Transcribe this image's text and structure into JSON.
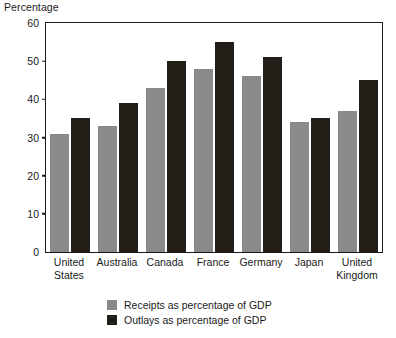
{
  "chart_data": {
    "type": "bar",
    "title": "",
    "subtitle": "",
    "xlabel": "",
    "ylabel": "Percentage",
    "ylim": [
      0,
      60
    ],
    "yticks": [
      0,
      10,
      20,
      30,
      40,
      50,
      60
    ],
    "grid": false,
    "legend_position": "bottom",
    "categories": [
      "United States",
      "Australia",
      "Canada",
      "France",
      "Germany",
      "Japan",
      "United Kingdom"
    ],
    "category_lines": [
      [
        "United",
        "States"
      ],
      [
        "Australia",
        ""
      ],
      [
        "Canada",
        ""
      ],
      [
        "France",
        ""
      ],
      [
        "Germany",
        ""
      ],
      [
        "Japan",
        ""
      ],
      [
        "United",
        "Kingdom"
      ]
    ],
    "series": [
      {
        "name": "Receipts as percentage of GDP",
        "color": "#8a8a8a",
        "values": [
          31,
          33,
          43,
          48,
          46,
          34,
          37
        ]
      },
      {
        "name": "Outlays as percentage of GDP",
        "color": "#231d17",
        "values": [
          35,
          39,
          50,
          55,
          51,
          35,
          45
        ]
      }
    ]
  },
  "axis": {
    "y_title": "Percentage",
    "tick_labels": [
      "60",
      "50",
      "40",
      "30",
      "20",
      "10",
      "0"
    ]
  },
  "legend": {
    "items": [
      {
        "label": "Receipts as percentage of GDP",
        "swatch": "receipts"
      },
      {
        "label": "Outlays as percentage of GDP",
        "swatch": "outlays"
      }
    ]
  }
}
